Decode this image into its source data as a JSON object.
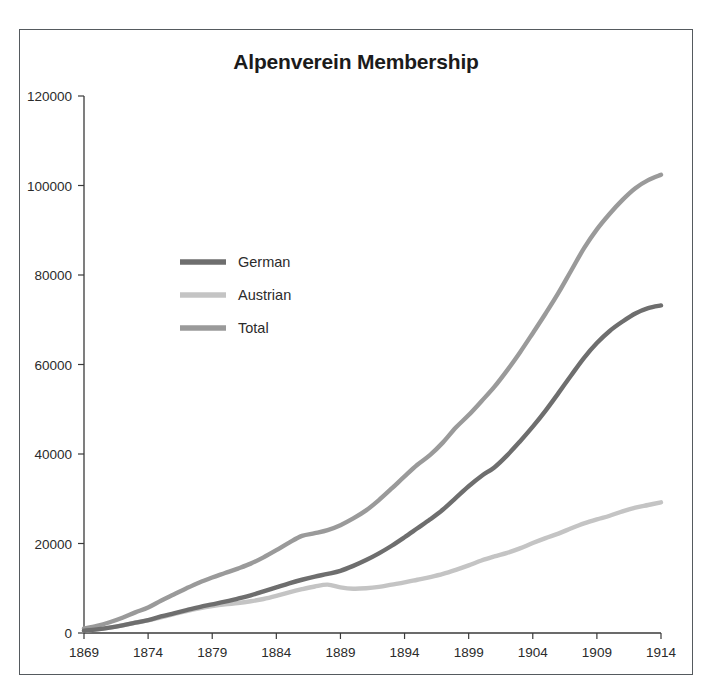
{
  "figure": {
    "title": "Alpenverein Membership",
    "border_color": "#555a5e",
    "background": "#ffffff"
  },
  "legend": {
    "position": "upper-left-inside",
    "entries": [
      {
        "label": "German",
        "color": "#6e6e6e"
      },
      {
        "label": "Austrian",
        "color": "#c4c4c4"
      },
      {
        "label": "Total",
        "color": "#9a9a9a"
      }
    ]
  },
  "axes": {
    "y_ticks": [
      "0",
      "20000",
      "40000",
      "60000",
      "80000",
      "100000",
      "120000"
    ],
    "x_ticks": [
      "1869",
      "1874",
      "1879",
      "1884",
      "1889",
      "1894",
      "1899",
      "1904",
      "1909",
      "1914"
    ]
  },
  "chart_data": {
    "type": "line",
    "title": "Alpenverein Membership",
    "xlabel": "",
    "ylabel": "",
    "xlim": [
      1869,
      1914
    ],
    "ylim": [
      0,
      120000
    ],
    "grid": false,
    "legend_position": "upper left",
    "x": [
      1869,
      1870,
      1871,
      1872,
      1873,
      1874,
      1875,
      1876,
      1877,
      1878,
      1879,
      1880,
      1881,
      1882,
      1883,
      1884,
      1885,
      1886,
      1887,
      1888,
      1889,
      1890,
      1891,
      1892,
      1893,
      1894,
      1895,
      1896,
      1897,
      1898,
      1899,
      1900,
      1901,
      1902,
      1903,
      1904,
      1905,
      1906,
      1907,
      1908,
      1909,
      1910,
      1911,
      1912,
      1913,
      1914
    ],
    "series": [
      {
        "name": "German",
        "color": "#6e6e6e",
        "values": [
          500,
          800,
          1200,
          1700,
          2300,
          2900,
          3700,
          4400,
          5100,
          5800,
          6400,
          7000,
          7700,
          8400,
          9300,
          10200,
          11100,
          11900,
          12600,
          13200,
          13900,
          15000,
          16300,
          17800,
          19500,
          21400,
          23400,
          25400,
          27600,
          30200,
          32800,
          35100,
          37000,
          39700,
          42800,
          46100,
          49700,
          53600,
          57600,
          61500,
          64800,
          67500,
          69600,
          71400,
          72600,
          73200
        ]
      },
      {
        "name": "Austrian",
        "color": "#c4c4c4",
        "values": [
          500,
          800,
          1200,
          1700,
          2300,
          2800,
          3500,
          4200,
          4900,
          5500,
          6000,
          6400,
          6700,
          7100,
          7600,
          8300,
          9100,
          9800,
          10400,
          10800,
          10200,
          9900,
          10000,
          10300,
          10800,
          11300,
          11900,
          12500,
          13200,
          14100,
          15100,
          16200,
          17100,
          17900,
          18900,
          20100,
          21200,
          22200,
          23400,
          24500,
          25400,
          26200,
          27200,
          28000,
          28600,
          29200
        ]
      },
      {
        "name": "Total",
        "color": "#9a9a9a",
        "values": [
          1000,
          1600,
          2400,
          3400,
          4600,
          5700,
          7200,
          8600,
          10000,
          11300,
          12400,
          13400,
          14400,
          15500,
          16900,
          18500,
          20200,
          21700,
          22300,
          23000,
          24100,
          25600,
          27400,
          29700,
          32300,
          35000,
          37600,
          39800,
          42600,
          45900,
          48700,
          51800,
          55000,
          58700,
          62700,
          67000,
          71400,
          76000,
          81000,
          86000,
          90200,
          93700,
          96800,
          99400,
          101200,
          102400
        ]
      }
    ]
  }
}
